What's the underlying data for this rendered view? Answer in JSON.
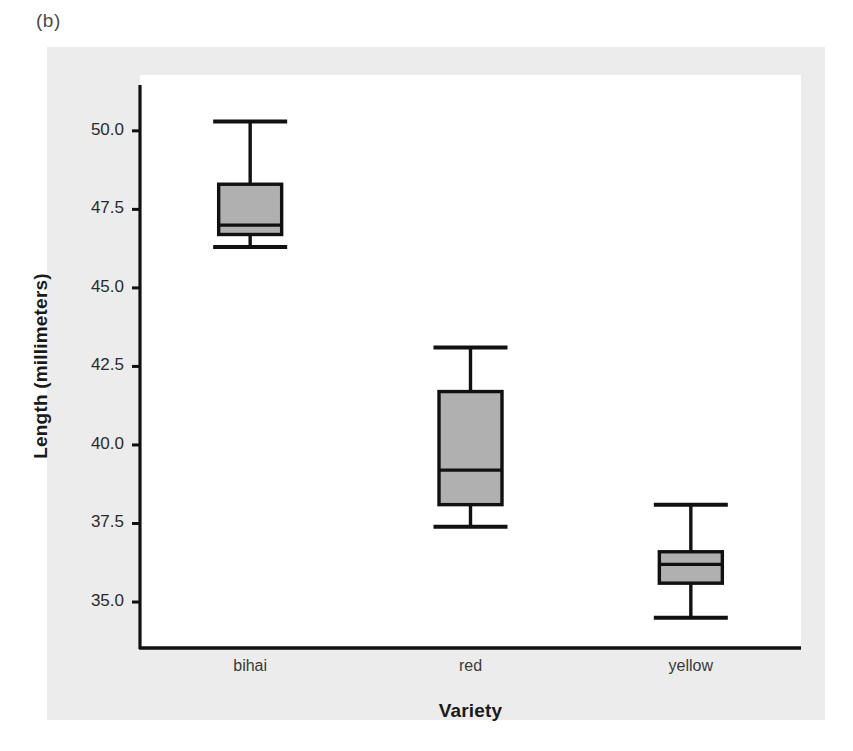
{
  "figure": {
    "panel_label": "(b)",
    "background_color": "#ffffff",
    "card_color": "#ececec",
    "plot_background": "#ffffff"
  },
  "chart_data": {
    "type": "box",
    "title": "",
    "subtitle": "",
    "xlabel": "Variety",
    "ylabel": "Length (millimeters)",
    "categories": [
      "bihai",
      "red",
      "yellow"
    ],
    "ylim": [
      33.6,
      51.3
    ],
    "yticks": [
      35.0,
      37.5,
      40.0,
      42.5,
      45.0,
      47.5,
      50.0
    ],
    "ytick_labels": [
      "35.0",
      "37.5",
      "40.0",
      "42.5",
      "45.0",
      "47.5",
      "50.0"
    ],
    "grid": false,
    "legend": "none",
    "box_fill": "#b0b0b0",
    "line_color": "#111111",
    "boxes": [
      {
        "category": "bihai",
        "whisker_low": 46.3,
        "q1": 46.7,
        "median": 47.0,
        "q3": 48.3,
        "whisker_high": 50.3
      },
      {
        "category": "red",
        "whisker_low": 37.4,
        "q1": 38.1,
        "median": 39.2,
        "q3": 41.7,
        "whisker_high": 43.1
      },
      {
        "category": "yellow",
        "whisker_low": 34.5,
        "q1": 35.6,
        "median": 36.2,
        "q3": 36.6,
        "whisker_high": 38.1
      }
    ]
  }
}
